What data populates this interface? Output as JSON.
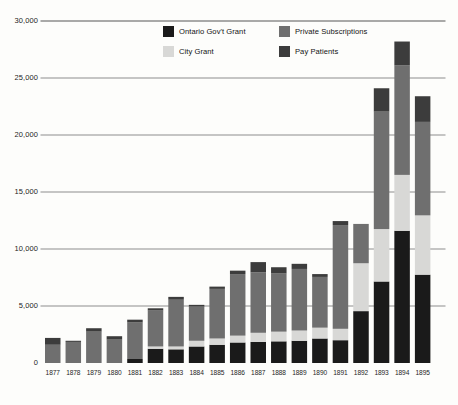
{
  "chart_data": {
    "type": "bar",
    "subtype": "stacked-vertical",
    "title": "",
    "xlabel": "",
    "ylabel": "",
    "ylim": [
      0,
      30000
    ],
    "yticks": [
      0,
      5000,
      10000,
      15000,
      20000,
      25000,
      30000
    ],
    "ytick_labels": [
      "0",
      "5,000",
      "10,000",
      "15,000",
      "20,000",
      "25,000",
      "30,000"
    ],
    "grid": true,
    "grid_axis": "y",
    "legend_position": "top-center",
    "categories": [
      "1877",
      "1878",
      "1879",
      "1880",
      "1881",
      "1882",
      "1883",
      "1884",
      "1885",
      "1886",
      "1887",
      "1888",
      "1889",
      "1890",
      "1891",
      "1892",
      "1893",
      "1894",
      "1895"
    ],
    "series": [
      {
        "name": "Ontario Gov't Grant",
        "color": "#1a1a1a",
        "values": [
          0,
          0,
          0,
          0,
          350,
          1250,
          1200,
          1450,
          1600,
          1800,
          1850,
          1900,
          1950,
          2150,
          2000,
          4550,
          7150,
          11600,
          7750
        ]
      },
      {
        "name": "City Grant",
        "color": "#d8d8d6",
        "values": [
          0,
          0,
          0,
          0,
          0,
          200,
          250,
          500,
          550,
          600,
          800,
          850,
          900,
          950,
          1000,
          4200,
          4600,
          4900,
          5200
        ]
      },
      {
        "name": "Private Subscriptions",
        "color": "#6f6f6f",
        "values": [
          1600,
          1850,
          2750,
          2050,
          3200,
          3150,
          4100,
          3000,
          4350,
          5400,
          5300,
          5100,
          5400,
          4450,
          9100,
          3450,
          10300,
          9600,
          8200
        ]
      },
      {
        "name": "Pay Patients",
        "color": "#3c3c3c",
        "values": [
          600,
          100,
          300,
          300,
          250,
          200,
          250,
          150,
          200,
          300,
          900,
          550,
          450,
          250,
          350,
          0,
          2050,
          2100,
          2250
        ]
      }
    ],
    "totals": [
      2200,
      1950,
      3050,
      2350,
      3800,
      4800,
      5800,
      5100,
      6700,
      8100,
      8850,
      8400,
      8700,
      7800,
      12450,
      12200,
      24100,
      28200,
      23400
    ]
  },
  "legend": {
    "items": [
      {
        "label": "Ontario Gov't Grant",
        "color": "#1a1a1a"
      },
      {
        "label": "City Grant",
        "color": "#d8d8d6"
      },
      {
        "label": "Private Subscriptions",
        "color": "#6f6f6f"
      },
      {
        "label": "Pay Patients",
        "color": "#3c3c3c"
      }
    ]
  },
  "axis_colors": {
    "gridline": "#8d8d8d",
    "text": "#1d1d1d",
    "background": "#fdfdfb"
  }
}
